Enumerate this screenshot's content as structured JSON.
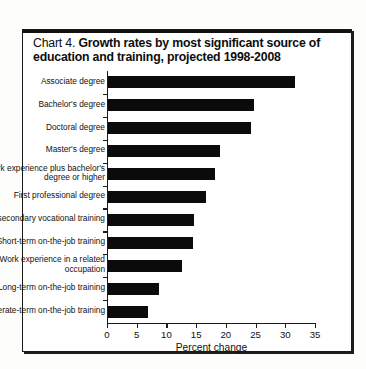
{
  "figure": {
    "number_label": "Chart 4.",
    "title": "Growth rates by most significant source of education and training, projected 1998-2008"
  },
  "chart_data": {
    "type": "bar",
    "orientation": "horizontal",
    "title": "Chart 4. Growth rates by most significant source of education and training, projected 1998-2008",
    "xlabel": "Percent change",
    "ylabel": "",
    "xlim": [
      0,
      35
    ],
    "xticks": [
      0,
      5,
      10,
      15,
      20,
      25,
      30,
      35
    ],
    "grid": false,
    "legend": "none",
    "bar_color": "#0b0b0b",
    "categories": [
      "Associate degree",
      "Bachelor's degree",
      "Doctoral degree",
      "Master's degree",
      "Work experience plus bachelor's degree or higher",
      "First professional degree",
      "Postsecondary vocational training",
      "Short-term on-the-job training",
      "Work experience in a related occupation",
      "Long-term on-the-job training",
      "Moderate-term on-the-job training"
    ],
    "category_lines": [
      [
        "Associate degree"
      ],
      [
        "Bachelor's degree"
      ],
      [
        "Doctoral degree"
      ],
      [
        "Master's degree"
      ],
      [
        "Work experience plus bachelor's",
        "degree or higher"
      ],
      [
        "First professional degree"
      ],
      [
        "Postsecondary vocational training"
      ],
      [
        "Short-term on-the-job training"
      ],
      [
        "Work experience in a related",
        "occupation"
      ],
      [
        "Long-term on-the-job training"
      ],
      [
        "Moderate-term on-the-job training"
      ]
    ],
    "values": [
      31.4,
      24.5,
      24.0,
      18.8,
      18.0,
      16.5,
      14.4,
      14.3,
      12.4,
      8.5,
      6.8
    ]
  }
}
